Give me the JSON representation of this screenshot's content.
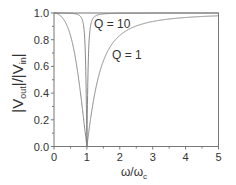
{
  "chart_data": {
    "type": "line",
    "title": "",
    "xlabel": "ω/ω_c",
    "xlabel_main": "ω/ω",
    "xlabel_sub": "c",
    "ylabel": "|V_out|/|V_in|",
    "ylabel_parts": {
      "bar1": "|V",
      "sub1": "out",
      "mid": "|/|V",
      "sub2": "in",
      "bar2": "|"
    },
    "xlim": [
      0,
      5
    ],
    "ylim": [
      0.0,
      1.0
    ],
    "x_ticks": [
      "0",
      "1",
      "2",
      "3",
      "4",
      "5"
    ],
    "y_ticks": [
      "0.0",
      "0.2",
      "0.4",
      "0.6",
      "0.8",
      "1.0"
    ],
    "grid": false,
    "legend": "none (inline annotations)",
    "annotations": [
      {
        "text": "Q = 10",
        "x": 1.25,
        "y": 0.93
      },
      {
        "text": "Q = 1",
        "x": 1.8,
        "y": 0.68
      }
    ],
    "series": [
      {
        "name": "Q = 1",
        "Q": 1,
        "x": [
          0,
          0.25,
          0.5,
          0.75,
          0.9,
          1.0,
          1.1,
          1.25,
          1.5,
          2.0,
          2.5,
          3.0,
          4.0,
          5.0
        ],
        "values": [
          1.0,
          0.966,
          0.832,
          0.496,
          0.206,
          0.0,
          0.19,
          0.412,
          0.64,
          0.832,
          0.907,
          0.936,
          0.966,
          0.979
        ]
      },
      {
        "name": "Q = 10",
        "Q": 10,
        "x": [
          0,
          0.5,
          0.75,
          0.9,
          0.95,
          1.0,
          1.05,
          1.1,
          1.25,
          1.5,
          2.0,
          5.0
        ],
        "values": [
          1.0,
          0.999,
          0.994,
          0.903,
          0.716,
          0.0,
          0.715,
          0.902,
          0.986,
          0.997,
          0.999,
          1.0
        ]
      }
    ]
  },
  "colors": {
    "curve": "#7a7a7a",
    "axis": "#777777",
    "text": "#333333",
    "background": "#ffffff"
  }
}
